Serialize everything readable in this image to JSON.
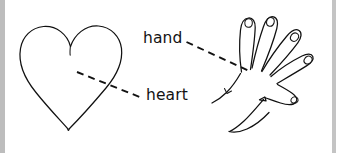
{
  "figure": {
    "name": "hand-and-heart-labeled-line-drawing",
    "background_color": "#ffffff",
    "ink_color": "#111111",
    "edge_band_color": "#bdbdbd",
    "width": 342,
    "height": 153
  },
  "labels": {
    "hand": "hand",
    "heart": "heart"
  },
  "drawings": {
    "heart": {
      "name": "heart-outline",
      "description": "hand-drawn heart outline with cleft at top and pointed bottom"
    },
    "hand": {
      "name": "open-hand-outline",
      "description": "hand-drawn open right hand, five fingers with fingernails, thumb at lower right"
    }
  },
  "leaders": {
    "hand_leader": {
      "name": "hand-leader-line",
      "style": "dashed",
      "from_label": "hand",
      "points_to": "palm of hand drawing"
    },
    "heart_leader": {
      "name": "heart-leader-line",
      "style": "dashed",
      "from_label": "heart",
      "points_to": "interior of heart drawing"
    }
  }
}
